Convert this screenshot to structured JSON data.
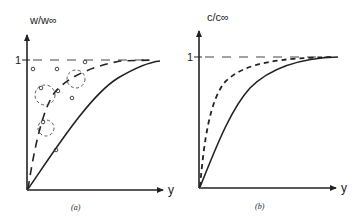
{
  "panels": [
    {
      "id": "a",
      "caption": "(a)",
      "ylabel": "w/w∞",
      "xlabel": "y",
      "tick_one": "1",
      "curves": [
        "solid",
        "long-dashed"
      ],
      "asymptote": "1 (dashed horizontal)",
      "annotations": "small open circles and dashed circular arrows (bubbles/eddies) along the dashed curve"
    },
    {
      "id": "b",
      "caption": "(b)",
      "ylabel": "c/c∞",
      "xlabel": "y",
      "tick_one": "1",
      "curves": [
        "solid",
        "short-dashed"
      ],
      "asymptote": "1 (dashed horizontal)"
    }
  ],
  "colors": {
    "ink": "#222222",
    "background": "#ffffff"
  }
}
